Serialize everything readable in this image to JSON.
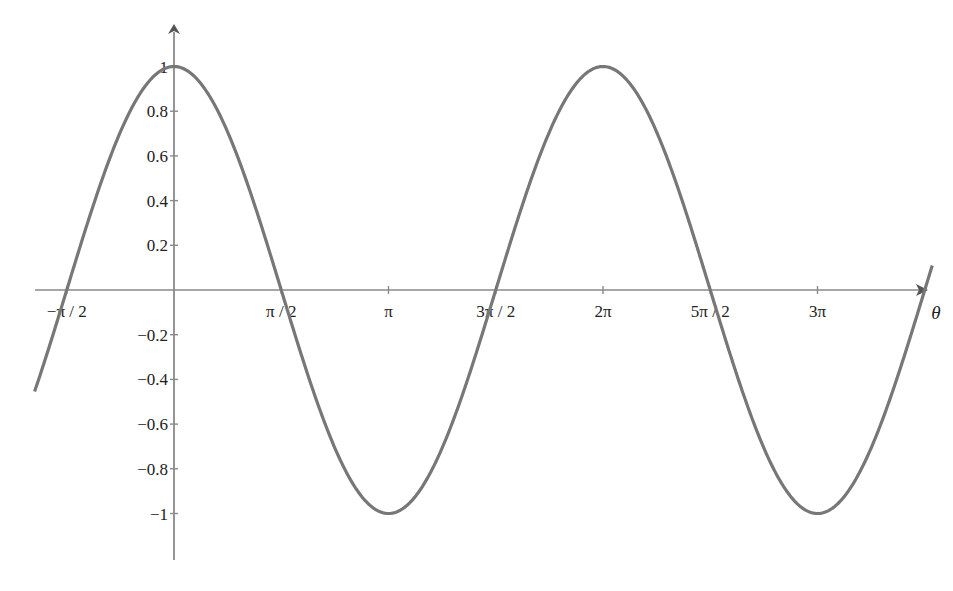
{
  "chart_data": {
    "type": "line",
    "title": "",
    "xlabel": "θ",
    "ylabel": "",
    "function": "cos(θ)",
    "xlim": [
      -2.04,
      3.52
    ],
    "xlim_units": "multiples of π",
    "ylim": [
      -1.25,
      1.1
    ],
    "grid": false,
    "legend": null,
    "x_ticks": [
      {
        "value": -0.5,
        "label": "−π / 2"
      },
      {
        "value": 0.5,
        "label": "π / 2"
      },
      {
        "value": 1.0,
        "label": "π"
      },
      {
        "value": 1.5,
        "label": "3π / 2"
      },
      {
        "value": 2.0,
        "label": "2π"
      },
      {
        "value": 2.5,
        "label": "5π / 2"
      },
      {
        "value": 3.0,
        "label": "3π"
      }
    ],
    "y_ticks": [
      {
        "value": 1,
        "label": "1"
      },
      {
        "value": 0.8,
        "label": "0.8"
      },
      {
        "value": 0.6,
        "label": "0.6"
      },
      {
        "value": 0.4,
        "label": "0.4"
      },
      {
        "value": 0.2,
        "label": "0.2"
      },
      {
        "value": -0.2,
        "label": "−0.2"
      },
      {
        "value": -0.4,
        "label": "−0.4"
      },
      {
        "value": -0.6,
        "label": "−0.6"
      },
      {
        "value": -0.8,
        "label": "−0.8"
      },
      {
        "value": -1,
        "label": "−1"
      }
    ],
    "series": [
      {
        "name": "cos θ",
        "x_in_pi": [
          -0.65,
          -0.5,
          -0.25,
          0,
          0.25,
          0.5,
          0.75,
          1.0,
          1.25,
          1.5,
          1.75,
          2.0,
          2.25,
          2.5,
          2.75,
          3.0,
          3.25,
          3.5
        ],
        "y": [
          -0.45,
          0,
          0.71,
          1,
          0.71,
          0,
          -0.71,
          -1,
          -0.71,
          0,
          0.71,
          1,
          0.71,
          0,
          -0.71,
          -1,
          -0.71,
          0
        ],
        "color": "#777777"
      }
    ]
  },
  "axis": {
    "x_label": "θ"
  }
}
